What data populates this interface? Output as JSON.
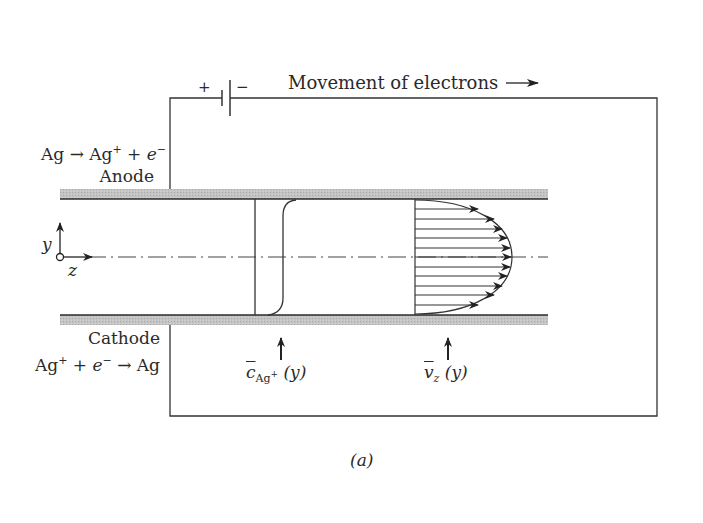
{
  "figure": {
    "caption": "(a)",
    "electron_flow_label": "Movement of electrons",
    "battery": {
      "plus": "+",
      "minus": "−"
    },
    "anode": {
      "name": "Anode",
      "reaction_left": "Ag → Ag",
      "reaction_sup": "+",
      "reaction_mid": " + ",
      "reaction_e": "e",
      "reaction_e_sup": "−"
    },
    "cathode": {
      "name": "Cathode",
      "reaction_ag": "Ag",
      "reaction_sup": "+",
      "reaction_plus": " + ",
      "reaction_e": "e",
      "reaction_e_sup": "−",
      "reaction_right": " → Ag"
    },
    "axes": {
      "y": "y",
      "z": "z"
    },
    "concentration_label": {
      "symbol": "c",
      "sub": "Ag",
      "sub_sup": "+",
      "arg": " (y)"
    },
    "velocity_label": {
      "symbol": "v",
      "sub": "z",
      "arg": " (y)"
    },
    "colors": {
      "line": "#333333",
      "wall_fill": "#bdbdbd",
      "wall_edge": "#2b2b2b"
    }
  }
}
